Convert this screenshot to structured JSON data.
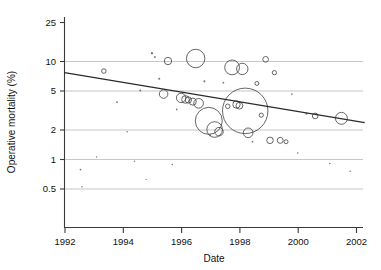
{
  "chart_data": {
    "type": "scatter",
    "title": "",
    "subtitle": "",
    "xlabel": "Date",
    "ylabel": "Operative mortality (%)",
    "xlim": [
      1992,
      2002
    ],
    "ylim": [
      0.4,
      28
    ],
    "yscale": "log",
    "xscale": "linear",
    "grid": "horizontal gridlines at each y tick",
    "legend": "none",
    "xticks": [
      1992,
      1994,
      1996,
      1998,
      2000,
      2002
    ],
    "xtick_labels": [
      "1992",
      "1994",
      "1996",
      "1998",
      "2000",
      "2002"
    ],
    "yticks": [
      25,
      10,
      5,
      2,
      1,
      0.5
    ],
    "ytick_labels": [
      "25",
      "10",
      "5",
      "2",
      "1",
      "0.5"
    ],
    "marker_style": "open circles sized by study weight plus small filled dots",
    "trend_line": {
      "label": "fitted regression line",
      "x_start": 1992.0,
      "y_start": 7.6,
      "x_end": 2002.3,
      "y_end": 2.35
    },
    "points": [
      {
        "x": 1992.55,
        "y": 0.78,
        "size": 1.0
      },
      {
        "x": 1992.6,
        "y": 0.52,
        "size": 0.9
      },
      {
        "x": 1993.1,
        "y": 1.05,
        "size": 0.8
      },
      {
        "x": 1993.35,
        "y": 7.9,
        "size": 1.6
      },
      {
        "x": 1993.8,
        "y": 3.8,
        "size": 1.0
      },
      {
        "x": 1994.15,
        "y": 1.9,
        "size": 0.9
      },
      {
        "x": 1994.4,
        "y": 0.95,
        "size": 0.9
      },
      {
        "x": 1994.6,
        "y": 5.0,
        "size": 1.1
      },
      {
        "x": 1994.8,
        "y": 0.62,
        "size": 0.8
      },
      {
        "x": 1995.0,
        "y": 12.0,
        "size": 1.3
      },
      {
        "x": 1995.1,
        "y": 11.0,
        "size": 1.1
      },
      {
        "x": 1995.25,
        "y": 6.6,
        "size": 1.2
      },
      {
        "x": 1995.4,
        "y": 4.6,
        "size": 3.0
      },
      {
        "x": 1995.55,
        "y": 10.0,
        "size": 2.6
      },
      {
        "x": 1995.7,
        "y": 0.88,
        "size": 0.9
      },
      {
        "x": 1995.85,
        "y": 3.2,
        "size": 1.0
      },
      {
        "x": 1996.0,
        "y": 4.2,
        "size": 3.3
      },
      {
        "x": 1996.15,
        "y": 4.05,
        "size": 2.7
      },
      {
        "x": 1996.25,
        "y": 4.0,
        "size": 2.2
      },
      {
        "x": 1996.4,
        "y": 3.85,
        "size": 2.5
      },
      {
        "x": 1996.5,
        "y": 10.6,
        "size": 6.5
      },
      {
        "x": 1996.6,
        "y": 3.7,
        "size": 3.4
      },
      {
        "x": 1996.8,
        "y": 6.2,
        "size": 1.2
      },
      {
        "x": 1996.95,
        "y": 2.45,
        "size": 9.5
      },
      {
        "x": 1997.0,
        "y": 1.75,
        "size": 1.1
      },
      {
        "x": 1997.15,
        "y": 2.0,
        "size": 5.5
      },
      {
        "x": 1997.3,
        "y": 1.9,
        "size": 3.0
      },
      {
        "x": 1997.45,
        "y": 6.0,
        "size": 1.0
      },
      {
        "x": 1997.6,
        "y": 3.45,
        "size": 1.6
      },
      {
        "x": 1997.75,
        "y": 8.6,
        "size": 5.2
      },
      {
        "x": 1997.9,
        "y": 3.6,
        "size": 2.6
      },
      {
        "x": 1998.0,
        "y": 3.5,
        "size": 2.4
      },
      {
        "x": 1998.1,
        "y": 8.3,
        "size": 4.0
      },
      {
        "x": 1998.2,
        "y": 3.1,
        "size": 16.0
      },
      {
        "x": 1998.3,
        "y": 1.85,
        "size": 3.4
      },
      {
        "x": 1998.45,
        "y": 1.5,
        "size": 1.0
      },
      {
        "x": 1998.6,
        "y": 5.9,
        "size": 1.4
      },
      {
        "x": 1998.75,
        "y": 2.8,
        "size": 1.5
      },
      {
        "x": 1998.9,
        "y": 10.4,
        "size": 2.0
      },
      {
        "x": 1999.05,
        "y": 1.55,
        "size": 2.3
      },
      {
        "x": 1999.2,
        "y": 7.6,
        "size": 1.5
      },
      {
        "x": 1999.4,
        "y": 1.55,
        "size": 2.1
      },
      {
        "x": 1999.6,
        "y": 1.5,
        "size": 1.4
      },
      {
        "x": 1999.8,
        "y": 4.6,
        "size": 1.0
      },
      {
        "x": 2000.0,
        "y": 1.15,
        "size": 0.9
      },
      {
        "x": 2000.3,
        "y": 2.9,
        "size": 1.1
      },
      {
        "x": 2000.6,
        "y": 2.75,
        "size": 2.0
      },
      {
        "x": 2001.1,
        "y": 0.9,
        "size": 0.9
      },
      {
        "x": 2001.5,
        "y": 2.6,
        "size": 4.2
      },
      {
        "x": 2001.8,
        "y": 0.75,
        "size": 0.9
      }
    ]
  },
  "axes": {
    "y_title": "Operative mortality (%)",
    "x_title": "Date"
  }
}
